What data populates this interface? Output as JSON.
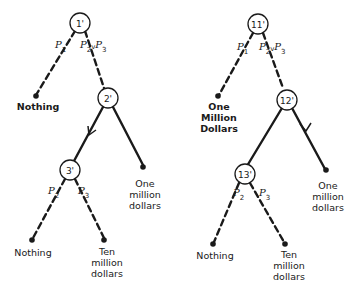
{
  "trees": [
    {
      "name": "left-tree",
      "nodes": {
        "n1": "1'",
        "n2": "2'",
        "n3": "3'"
      },
      "probs": {
        "p1": "P",
        "p1_sub": "1",
        "p23": "P",
        "p23_sub1": "2",
        "p23_v": "v",
        "p23b": "P",
        "p23_sub2": "3",
        "p2": "P",
        "p2_sub": "2",
        "p3": "P",
        "p3_sub": "3"
      },
      "outcomes": {
        "top_left": "Nothing",
        "mid_right": "One\nmillion\ndollars",
        "bottom_left": "Nothing",
        "bottom_right": "Ten\nmillion\ndollars"
      }
    },
    {
      "name": "right-tree",
      "nodes": {
        "n1": "11'",
        "n2": "12'",
        "n3": "13'"
      },
      "probs": {
        "p1": "P",
        "p1_sub": "1",
        "p23": "P",
        "p23_sub1": "2",
        "p23_v": "v",
        "p23b": "P",
        "p23_sub2": "3",
        "p2": "P",
        "p2_sub": "2",
        "p3": "P",
        "p3_sub": "3"
      },
      "outcomes": {
        "top_left": "One\nMillion\nDollars",
        "mid_right": "One\nmillion\ndollars",
        "bottom_left": "Nothing",
        "bottom_right": "Ten\nmillion\ndollars"
      }
    }
  ]
}
